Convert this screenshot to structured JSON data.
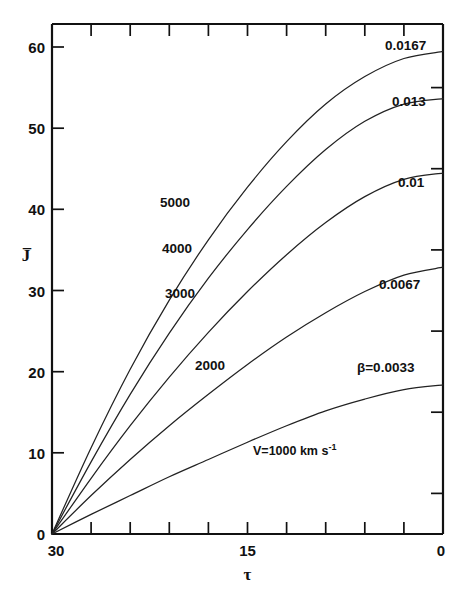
{
  "figure": {
    "background": "#ffffff",
    "ink": "#111111"
  },
  "axes": {
    "x_title": "τ",
    "y_title": "J̅",
    "x_ticklabels": [
      "30",
      "15",
      "0"
    ],
    "y_ticklabels": [
      "0",
      "10",
      "20",
      "30",
      "40",
      "50",
      "60"
    ]
  },
  "chart_data": {
    "type": "line",
    "title": "",
    "xlabel": "τ",
    "ylabel": "J̅",
    "xlim": [
      30,
      0
    ],
    "ylim": [
      0,
      65
    ],
    "x_reversed": true,
    "grid": false,
    "legend": "inline-curve-labels",
    "x_major_ticks": [
      30,
      15,
      0
    ],
    "x_minor_ticks": [
      27,
      24,
      21,
      18,
      15,
      12,
      9,
      6,
      3
    ],
    "y_major_ticks": [
      0,
      10,
      20,
      30,
      40,
      50,
      60
    ],
    "y_minor_ticks": [
      5,
      15,
      25,
      35,
      45,
      55
    ],
    "x": [
      30,
      27,
      24,
      21,
      18,
      15,
      12,
      9,
      6,
      3,
      0
    ],
    "series": [
      {
        "name": "V=5000 km/s, beta=0.0167",
        "velocity_label": "5000",
        "beta_label": "0.0167",
        "values": [
          0,
          11.0,
          21.0,
          29.8,
          37.5,
          44.2,
          50.0,
          54.8,
          58.3,
          60.6,
          61.5
        ]
      },
      {
        "name": "V=4000 km/s, beta=0.013",
        "velocity_label": "4000",
        "beta_label": "0.013",
        "values": [
          0,
          9.2,
          17.8,
          25.6,
          32.6,
          38.8,
          44.3,
          49.0,
          52.6,
          54.8,
          55.5
        ]
      },
      {
        "name": "V=3000 km/s, beta=0.01",
        "velocity_label": "3000",
        "beta_label": "0.01",
        "values": [
          0,
          7.1,
          13.8,
          20.0,
          25.7,
          30.9,
          35.6,
          39.7,
          43.0,
          45.2,
          46.0
        ]
      },
      {
        "name": "V=2000 km/s, beta=0.0067",
        "velocity_label": "2000",
        "beta_label": "0.0067",
        "values": [
          0,
          4.9,
          9.5,
          13.8,
          17.8,
          21.6,
          25.1,
          28.2,
          30.9,
          33.0,
          34.0
        ]
      },
      {
        "name": "V=1000 km/s, beta=0.0033",
        "velocity_label": "V=1000 km s",
        "velocity_label_exponent": "-1",
        "beta_label": "β=0.0033",
        "values": [
          0,
          2.5,
          4.9,
          7.3,
          9.5,
          11.7,
          13.8,
          15.7,
          17.2,
          18.4,
          19.0
        ]
      }
    ]
  },
  "labels": {
    "v5000": "5000",
    "v4000": "4000",
    "v3000": "3000",
    "v2000": "2000",
    "v1000": "V=1000 km s",
    "v1000_exp": "-1",
    "beta0167": "0.0167",
    "beta013": "0.013",
    "beta01": "0.01",
    "beta0067": "0.0067",
    "beta0033": "β=0.0033"
  }
}
